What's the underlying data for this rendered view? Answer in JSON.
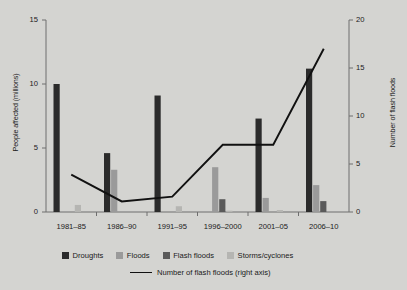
{
  "chart_data": {
    "type": "bar",
    "title": "",
    "categories": [
      "1981–85",
      "1986–90",
      "1991–95",
      "1996–2000",
      "2001–05",
      "2006–10"
    ],
    "series": [
      {
        "name": "Droughts",
        "axis": "left",
        "color": "#2b2b2b",
        "values": [
          10.0,
          4.6,
          9.1,
          0.0,
          7.3,
          11.2
        ]
      },
      {
        "name": "Floods",
        "axis": "left",
        "color": "#9a9a9a",
        "values": [
          0.0,
          3.3,
          0.0,
          3.5,
          1.1,
          2.1
        ]
      },
      {
        "name": "Flash floods",
        "axis": "left",
        "color": "#5a5a5a",
        "values": [
          0.0,
          0.0,
          0.0,
          1.0,
          0.0,
          0.85
        ]
      },
      {
        "name": "Storms/cyclones",
        "axis": "left",
        "color": "#b5b5b2",
        "values": [
          0.55,
          0.0,
          0.45,
          0.1,
          0.15,
          0.0
        ]
      }
    ],
    "line_series": {
      "name": "Number of flash floods (right axis)",
      "axis": "right",
      "color": "#111111",
      "values": [
        3.9,
        1.1,
        1.6,
        7.0,
        7.0,
        17.0
      ]
    },
    "xlabel": "",
    "ylabel": "People affected (millions)",
    "ylabel_right": "Number of flash floods",
    "ylim": [
      0,
      15
    ],
    "yticks": [
      "0",
      "5",
      "10",
      "15"
    ],
    "ylim_right": [
      0,
      20
    ],
    "yticks_right": [
      "0",
      "5",
      "10",
      "15",
      "20"
    ],
    "grid": false,
    "legend_position": "bottom"
  },
  "legend": {
    "items": [
      {
        "label": "Droughts"
      },
      {
        "label": "Floods"
      },
      {
        "label": "Flash floods"
      },
      {
        "label": "Storms/cyclones"
      }
    ],
    "line_label": "Number of flash floods (right axis)"
  },
  "colors": {
    "background": "#d4d4d1",
    "axis": "#6e6e6e",
    "text": "#1a1a1a",
    "droughts": "#2b2b2b",
    "floods": "#9a9a9a",
    "flash_floods": "#5a5a5a",
    "storms_cyclones": "#b5b5b2",
    "line": "#111111"
  }
}
